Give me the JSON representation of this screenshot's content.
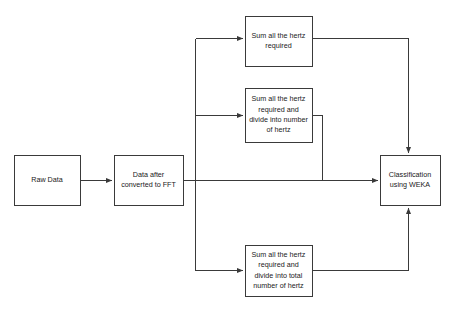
{
  "diagram": {
    "type": "flowchart",
    "background_color": "#ffffff",
    "stroke_color": "#3a3a3a",
    "text_color": "#1a1a1a",
    "nodes": [
      {
        "id": "raw-data",
        "label": "Raw Data",
        "x": 14,
        "y": 155,
        "w": 66,
        "h": 50
      },
      {
        "id": "fft",
        "label": "Data after\nconverted to FFT",
        "x": 114,
        "y": 155,
        "w": 69,
        "h": 50
      },
      {
        "id": "sum-hertz",
        "label": "Sum all the hertz\nrequired",
        "x": 245,
        "y": 16,
        "w": 67,
        "h": 50
      },
      {
        "id": "sum-divide-number",
        "label": "Sum all the hertz\nrequired and\ndivide into number\nof hertz",
        "x": 245,
        "y": 88,
        "w": 67,
        "h": 54
      },
      {
        "id": "sum-divide-total",
        "label": "Sum all the hertz\nrequired and\ndivide into total\nnumber of hertz",
        "x": 245,
        "y": 245,
        "w": 67,
        "h": 51
      },
      {
        "id": "classification",
        "label": "Classification\nusing WEKA",
        "x": 380,
        "y": 155,
        "w": 60,
        "h": 50
      }
    ],
    "edges": [
      {
        "id": "raw-to-fft",
        "from": "raw-data",
        "to": "fft"
      },
      {
        "id": "fft-to-bus",
        "from": "fft",
        "to": "branch-bus"
      },
      {
        "id": "bus-to-sum-hertz",
        "from": "branch-bus",
        "to": "sum-hertz"
      },
      {
        "id": "bus-to-sum-divide-number",
        "from": "branch-bus",
        "to": "sum-divide-number"
      },
      {
        "id": "bus-to-sum-divide-total",
        "from": "branch-bus",
        "to": "sum-divide-total"
      },
      {
        "id": "sum-hertz-to-classification",
        "from": "sum-hertz",
        "to": "classification"
      },
      {
        "id": "sum-divide-number-to-classification",
        "from": "sum-divide-number",
        "to": "classification"
      },
      {
        "id": "fft-direct-to-classification",
        "from": "fft",
        "to": "classification"
      },
      {
        "id": "sum-divide-total-to-classification",
        "from": "sum-divide-total",
        "to": "classification"
      }
    ]
  }
}
